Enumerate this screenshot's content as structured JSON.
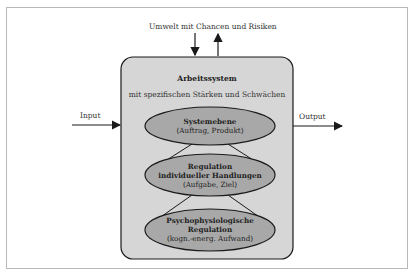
{
  "diagram": {
    "environment_label": "Umwelt mit Chancen und Risiken",
    "input_label": "Input",
    "output_label": "Output",
    "system": {
      "title": "Arbeitssystem",
      "subtitle": "mit spezifischen Stärken und Schwächen"
    },
    "levels": [
      {
        "title": "Systemebene",
        "title2": "",
        "detail": "(Auftrag, Produkt)"
      },
      {
        "title": "Regulation",
        "title2": "individueller Handlungen",
        "detail": "(Aufgabe, Ziel)"
      },
      {
        "title": "Psychophysiologische",
        "title2": "Regulation",
        "detail": "(kogn.-energ. Aufwand)"
      }
    ],
    "colors": {
      "box_fill": "#d6d6d6",
      "ellipse_fill": "#a8a8a8",
      "stroke": "#1a1a1a"
    }
  }
}
